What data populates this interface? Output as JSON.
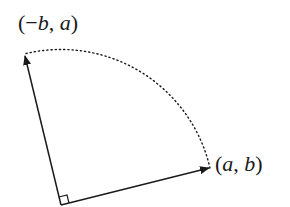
{
  "diagram": {
    "title": "",
    "labels": {
      "rotated_vector": "(−b, a)",
      "original_vector": "(a, b)"
    },
    "elements": {
      "origin": {
        "x": 61,
        "y": 205
      },
      "vector_ab_tip": {
        "x": 210,
        "y": 168
      },
      "vector_neg_b_a_tip": {
        "x": 24,
        "y": 54
      },
      "arc_style": "dotted",
      "right_angle_marker": true
    },
    "colors": {
      "stroke": "#1a1a1a",
      "background": "#ffffff"
    }
  }
}
